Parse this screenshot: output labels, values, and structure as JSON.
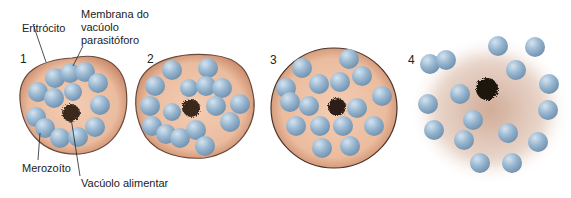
{
  "labels": {
    "eritrocito": "Eritrócito",
    "membrana_l1": "Membrana do",
    "membrana_l2": "vacúolo",
    "membrana_l3": "parasitóforo",
    "merozoito": "Merozoíto",
    "vacuolo_alimentar": "Vacúolo alimentar"
  },
  "stages": [
    {
      "number": "1"
    },
    {
      "number": "2"
    },
    {
      "number": "3"
    },
    {
      "number": "4"
    }
  ],
  "colors": {
    "cytoplasm": "#e9b89a",
    "membrane_edge": "#6b4a3a",
    "merozoite": "#8fb0cc",
    "merozoite_highlight": "#c4d8e8",
    "food_vacuole": "#3a2a1e",
    "ruptured_halo": "#c9a08a"
  }
}
